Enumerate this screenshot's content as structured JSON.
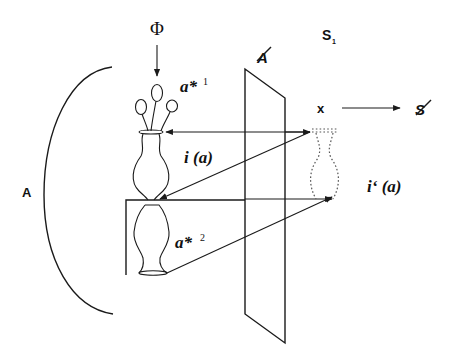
{
  "diagram": {
    "type": "optical-schema",
    "labels": {
      "phi": "Φ",
      "a_star_1": "a*",
      "a_star_1_sup": "1",
      "a_star_2": "a*",
      "a_star_2_sup": "2",
      "i_a": "i (a)",
      "i_prime_a": "i‘ (a)",
      "A": "A",
      "A_barred": "A",
      "S1": "S",
      "S1_sub": "1",
      "x": "x",
      "S_barred": "S"
    },
    "elements": [
      "concave-mirror-arc",
      "plane-mirror",
      "vase-with-flowers",
      "inverted-vase",
      "virtual-image-vase",
      "light-ray-arrows"
    ],
    "colors": {
      "line": "#1a1a1a",
      "dotted": "#555555",
      "background": "#ffffff"
    }
  }
}
